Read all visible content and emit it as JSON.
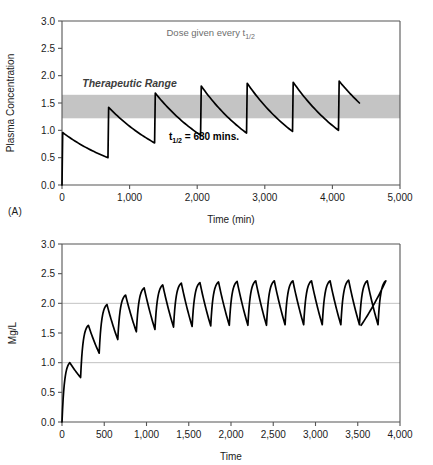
{
  "figure": {
    "panel_a_label": "(A)",
    "panel_b_label": "(B)"
  },
  "chart_data": [
    {
      "id": "A",
      "type": "line",
      "title": "",
      "xlabel": "Time (min)",
      "ylabel": "Plasma Concentration",
      "xlim": [
        0,
        5000
      ],
      "ylim": [
        0,
        3.0
      ],
      "xticks": [
        0,
        1000,
        2000,
        3000,
        4000,
        5000
      ],
      "xticklabels": [
        "0",
        "1,000",
        "2,000",
        "3,000",
        "4,000",
        "5,000"
      ],
      "yticks": [
        0.0,
        0.5,
        1.0,
        1.5,
        2.0,
        2.5,
        3.0
      ],
      "yticklabels": [
        "0.0",
        "0.5",
        "1.0",
        "1.5",
        "2.0",
        "2.5",
        "3.0"
      ],
      "grid": false,
      "legend": "none",
      "annotations": [
        {
          "name": "dose-interval-note",
          "text": "Dose given every t",
          "sub": "1/2",
          "x": 2200,
          "y": 2.72,
          "style": "gray"
        },
        {
          "name": "therapeutic-range-label",
          "text": "Therapeutic Range",
          "x": 300,
          "y": 1.8,
          "style": "italic-bold-gray"
        },
        {
          "name": "half-life-note",
          "text": "t",
          "sub": "1/2",
          "text2": " = 680 mins.",
          "x": 2100,
          "y": 0.82,
          "style": "bold"
        }
      ],
      "shaded_band": {
        "name": "therapeutic-range",
        "y_low": 1.22,
        "y_high": 1.65,
        "color": "#c4c4c4"
      },
      "dose_interval": 680,
      "half_life": 680,
      "series": [
        {
          "name": "plasma-concentration",
          "color": "#000000",
          "points": [
            [
              0,
              0.0
            ],
            [
              10,
              0.96
            ],
            [
              680,
              0.5
            ],
            [
              690,
              1.42
            ],
            [
              1370,
              0.77
            ],
            [
              1380,
              1.68
            ],
            [
              2050,
              0.91
            ],
            [
              2060,
              1.81
            ],
            [
              2730,
              0.95
            ],
            [
              2740,
              1.86
            ],
            [
              3410,
              0.98
            ],
            [
              3420,
              1.88
            ],
            [
              4090,
              1.0
            ],
            [
              4100,
              1.9
            ],
            [
              4400,
              1.5
            ]
          ],
          "decay_shape": "exponential"
        }
      ]
    },
    {
      "id": "B",
      "type": "line",
      "title": "",
      "xlabel": "Time",
      "ylabel": "Mg/L",
      "xlim": [
        0,
        4000
      ],
      "ylim": [
        0,
        3.0
      ],
      "xticks": [
        0,
        500,
        1000,
        1500,
        2000,
        2500,
        3000,
        3500,
        4000
      ],
      "xticklabels": [
        "0",
        "500",
        "1,000",
        "1,500",
        "2,000",
        "2,500",
        "3,000",
        "3,500",
        "4,000"
      ],
      "yticks": [
        0.0,
        0.5,
        1.0,
        1.5,
        2.0,
        2.5,
        3.0
      ],
      "yticklabels": [
        "0.0",
        "0.5",
        "1.0",
        "1.5",
        "2.0",
        "2.5",
        "3.0"
      ],
      "grid": true,
      "gridlines_y": [
        1.0,
        2.0
      ],
      "legend": "none",
      "dose_interval": 220,
      "series": [
        {
          "name": "mg-per-litre",
          "color": "#000000",
          "peaks": [
            1.0,
            1.63,
            1.98,
            2.14,
            2.26,
            2.31,
            2.34,
            2.35,
            2.36,
            2.37,
            2.38,
            2.38,
            2.38,
            2.38,
            2.38,
            2.39,
            2.38,
            2.38
          ],
          "troughs": [
            0.75,
            1.16,
            1.39,
            1.52,
            1.56,
            1.6,
            1.61,
            1.62,
            1.63,
            1.63,
            1.63,
            1.64,
            1.64,
            1.64,
            1.64,
            1.64,
            1.64
          ],
          "start": [
            0,
            0.0
          ],
          "end": [
            3540,
            1.63
          ]
        }
      ]
    }
  ]
}
